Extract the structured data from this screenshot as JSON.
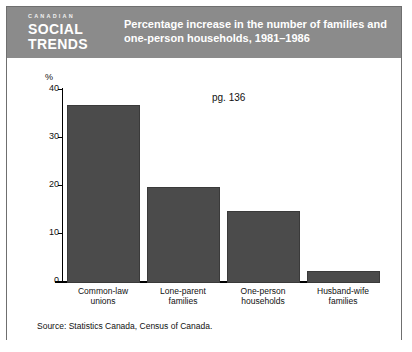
{
  "publication": {
    "eyebrow": "CANADIAN",
    "name_line1": "SOCIAL",
    "name_line2": "TRENDS"
  },
  "header": {
    "title_line1": "Percentage increase in the number of families and",
    "title_line2": "one-person households, 1981–1986",
    "band_color": "#8b8b8b"
  },
  "annotation": {
    "page_reference": "pg. 136"
  },
  "source": {
    "text": "Source: Statistics Canada, Census of Canada."
  },
  "chart_data": {
    "type": "bar",
    "title": "Percentage increase in the number of families and one-person households, 1981–1986",
    "subtitle": "",
    "xlabel": "",
    "ylabel": "%",
    "categories": [
      "Common-law unions",
      "Lone-parent families",
      "One-person households",
      "Husband-wife families"
    ],
    "category_lines": [
      [
        "Common-law",
        "unions"
      ],
      [
        "Lone-parent",
        "families"
      ],
      [
        "One-person",
        "households"
      ],
      [
        "Husband-wife",
        "families"
      ]
    ],
    "values": [
      37,
      20,
      15,
      2.5
    ],
    "ylim": [
      0,
      40
    ],
    "yticks": [
      0,
      10,
      20,
      30,
      40
    ],
    "ytick_labels": [
      "0",
      "10",
      "20",
      "30",
      "40"
    ],
    "grid": false,
    "legend": false,
    "bar_color": "#4b4b4b",
    "axis_color": "#000000"
  }
}
